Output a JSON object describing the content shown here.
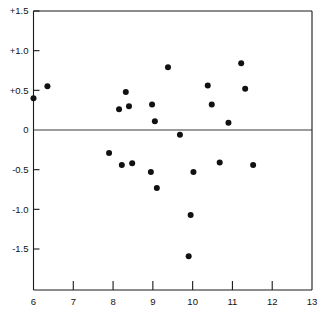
{
  "chart_data": {
    "type": "scatter",
    "title": "",
    "subtitle": "",
    "xlabel": "",
    "ylabel": "",
    "xlim": [
      6,
      13
    ],
    "ylim": [
      -1.75,
      1.5
    ],
    "grid": false,
    "legend": null,
    "zero_reference_line": 0,
    "x_ticks": [
      6,
      7,
      8,
      9,
      10,
      11,
      12,
      13
    ],
    "x_tick_labels": [
      "6",
      "7",
      "8",
      "9",
      "10",
      "11",
      "12",
      "13"
    ],
    "y_ticks": [
      1.5,
      1.0,
      0.5,
      0,
      -0.5,
      -1.0,
      -1.5
    ],
    "y_tick_labels": [
      "+1.5",
      "+1.0",
      "+0.5",
      "0",
      "-0.5",
      "-1.0",
      "-1.5"
    ],
    "marker": "filled-circle",
    "marker_color": "#111111",
    "point_count": 26,
    "x": [
      6.0,
      6.35,
      7.9,
      8.15,
      8.22,
      8.32,
      8.4,
      8.48,
      8.95,
      8.98,
      9.05,
      9.1,
      9.15,
      9.38,
      9.68,
      9.9,
      9.95,
      10.02,
      10.05,
      10.38,
      10.48,
      10.68,
      10.9,
      11.22,
      11.32,
      11.52
    ],
    "y": [
      0.4,
      0.55,
      -0.29,
      0.26,
      -0.44,
      0.48,
      0.3,
      -0.42,
      -0.53,
      0.32,
      0.11,
      -0.73,
      0.11,
      0.79,
      -0.06,
      -1.59,
      -1.07,
      -0.53,
      -0.53,
      0.56,
      0.32,
      -0.41,
      0.09,
      0.84,
      0.52,
      -0.44
    ],
    "points": [
      {
        "x": 6.0,
        "y": 0.4
      },
      {
        "x": 6.35,
        "y": 0.55
      },
      {
        "x": 7.9,
        "y": -0.29
      },
      {
        "x": 8.15,
        "y": 0.26
      },
      {
        "x": 8.22,
        "y": -0.44
      },
      {
        "x": 8.32,
        "y": 0.48
      },
      {
        "x": 8.4,
        "y": 0.3
      },
      {
        "x": 8.48,
        "y": -0.42
      },
      {
        "x": 8.95,
        "y": -0.53
      },
      {
        "x": 8.98,
        "y": 0.32
      },
      {
        "x": 9.05,
        "y": 0.11
      },
      {
        "x": 9.1,
        "y": -0.73
      },
      {
        "x": 9.38,
        "y": 0.79
      },
      {
        "x": 9.68,
        "y": -0.06
      },
      {
        "x": 9.9,
        "y": -1.59
      },
      {
        "x": 9.95,
        "y": -1.07
      },
      {
        "x": 10.02,
        "y": -0.53
      },
      {
        "x": 10.38,
        "y": 0.56
      },
      {
        "x": 10.48,
        "y": 0.32
      },
      {
        "x": 10.68,
        "y": -0.41
      },
      {
        "x": 10.9,
        "y": 0.09
      },
      {
        "x": 11.22,
        "y": 0.84
      },
      {
        "x": 11.32,
        "y": 0.52
      },
      {
        "x": 11.52,
        "y": -0.44
      }
    ]
  },
  "figure": {
    "background_color": "#ffffff",
    "axis_color": "#1a1a1a",
    "marker_radius_px": 3.0
  }
}
